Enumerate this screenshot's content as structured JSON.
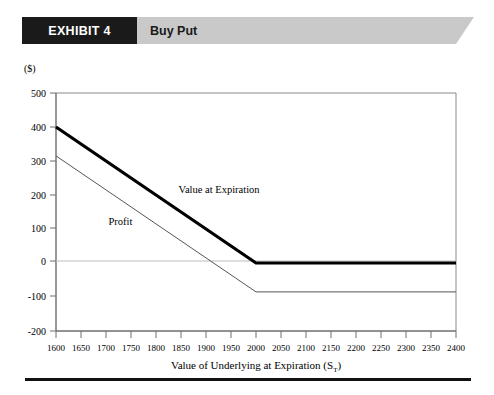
{
  "header": {
    "exhibit_tag": "EXHIBIT 4",
    "subject": "Buy Put"
  },
  "chart_data": {
    "type": "line",
    "title": "Buy Put",
    "xlabel": "Value of Underlying at Expiration (S",
    "xlabel_subscript": "T",
    "xlabel_suffix": ")",
    "ylabel": "($)",
    "y_unit_label": "($)",
    "xlim": [
      1600,
      2400
    ],
    "ylim": [
      -200,
      500
    ],
    "xticks": [
      1600,
      1650,
      1700,
      1750,
      1800,
      1850,
      1900,
      1950,
      2000,
      2050,
      2100,
      2150,
      2200,
      2250,
      2300,
      2350,
      2400
    ],
    "yticks": [
      500,
      400,
      300,
      200,
      100,
      0,
      -100,
      -200
    ],
    "xtick_labels": [
      "1600",
      "1650",
      "1700",
      "1750",
      "1800",
      "1850",
      "1900",
      "1950",
      "2000",
      "2050",
      "2100",
      "2150",
      "2200",
      "2250",
      "2300",
      "2350",
      "2400"
    ],
    "ytick_labels": [
      "500",
      "400",
      "300",
      "200",
      "100",
      "0",
      "-100",
      "-200"
    ],
    "grid": false,
    "zero_line": true,
    "strike": 2000,
    "premium": 85,
    "legend_position": "inline-annotation",
    "series": [
      {
        "name": "Value at Expiration",
        "color": "#000000",
        "width": 3.2,
        "label_x": 1845,
        "label_y": 205,
        "x": [
          1600,
          2000,
          2400
        ],
        "values": [
          400,
          0,
          0
        ]
      },
      {
        "name": "Profit",
        "color": "#555555",
        "width": 1,
        "label_x": 1705,
        "label_y": 112,
        "x": [
          1600,
          2000,
          2400
        ],
        "values": [
          315,
          -85,
          -85
        ]
      }
    ]
  }
}
